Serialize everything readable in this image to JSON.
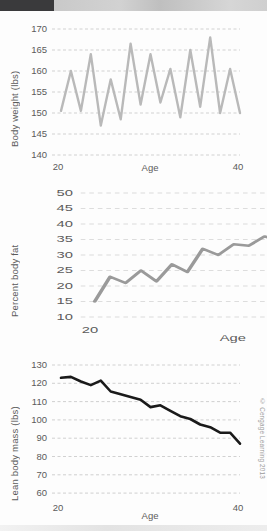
{
  "figure": {
    "copyright": "© Cengage Learning 2013"
  },
  "chart_data": [
    {
      "id": "body-weight",
      "type": "line",
      "title": "",
      "xlabel": "Age",
      "ylabel": "Body weight (lbs)",
      "xlim": [
        20,
        40
      ],
      "ylim": [
        140,
        170
      ],
      "xticks": [
        20,
        40
      ],
      "yticks": [
        140,
        145,
        150,
        155,
        160,
        165,
        170
      ],
      "grid": true,
      "legend": "none",
      "line_color": "#b9b9b9",
      "x": [
        21,
        22,
        23,
        24,
        25,
        26,
        27,
        28,
        29,
        30,
        31,
        32,
        33,
        34,
        35,
        36,
        37,
        38,
        39
      ],
      "values": [
        150.5,
        160.0,
        150.5,
        164.0,
        147.0,
        158.0,
        148.5,
        166.5,
        152.0,
        164.0,
        152.5,
        160.5,
        149.0,
        165.0,
        151.5,
        168.0,
        150.0,
        160.5,
        150.0
      ]
    },
    {
      "id": "percent-body-fat",
      "type": "line",
      "title": "",
      "xlabel": "Age",
      "ylabel": "Percent body fat",
      "xlim": [
        20,
        40
      ],
      "ylim": [
        10,
        50
      ],
      "xticks": [
        20,
        40
      ],
      "yticks": [
        10,
        15,
        20,
        25,
        30,
        35,
        40,
        45,
        50
      ],
      "grid": true,
      "legend": "none",
      "line_color": "#9a9a9a",
      "x": [
        21,
        22,
        23,
        24,
        25,
        26,
        27,
        28,
        29,
        30,
        31,
        32,
        33,
        34,
        35,
        36,
        37,
        38,
        39
      ],
      "values": [
        15.0,
        23.0,
        21.0,
        25.0,
        21.5,
        27.0,
        24.5,
        32.0,
        30.0,
        33.5,
        33.0,
        36.0,
        34.5,
        41.0,
        39.0,
        44.0,
        42.0,
        43.0,
        42.0
      ]
    },
    {
      "id": "lean-body-mass",
      "type": "line",
      "title": "",
      "xlabel": "Age",
      "ylabel": "Lean body mass (lbs)",
      "xlim": [
        20,
        40
      ],
      "ylim": [
        60,
        130
      ],
      "xticks": [
        20,
        40
      ],
      "yticks": [
        60,
        70,
        80,
        90,
        100,
        110,
        120,
        130
      ],
      "grid": true,
      "legend": "none",
      "line_color": "#1a1a1a",
      "x": [
        21,
        22,
        23,
        24,
        25,
        26,
        27,
        28,
        29,
        30,
        31,
        32,
        33,
        34,
        35,
        36,
        37,
        38,
        39
      ],
      "values": [
        123.0,
        123.5,
        121.0,
        119.0,
        121.5,
        115.5,
        114.0,
        112.5,
        111.0,
        107.0,
        108.0,
        105.0,
        102.0,
        100.5,
        97.5,
        96.0,
        93.0,
        93.0,
        87.0
      ]
    }
  ]
}
